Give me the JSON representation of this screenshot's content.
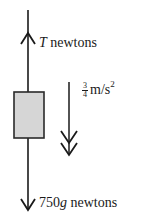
{
  "diagram": {
    "type": "free-body diagram",
    "body": {
      "shape": "rectangle",
      "fill": "#d6d6d6",
      "stroke": "#2a2a2a"
    },
    "forces": [
      {
        "name": "tension",
        "direction": "up",
        "symbol": "T",
        "unit": "newtons"
      },
      {
        "name": "weight",
        "direction": "down",
        "value": "750",
        "symbol": "g",
        "unit": "newtons"
      }
    ],
    "acceleration": {
      "direction": "down",
      "numerator": "3",
      "denominator": "4",
      "unit": "m/s",
      "exponent": "2",
      "arrow": "double-headed"
    }
  }
}
